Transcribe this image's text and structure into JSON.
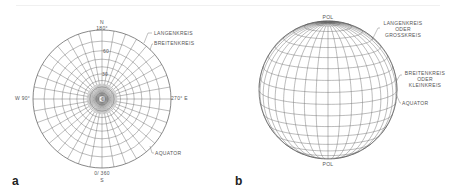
{
  "figure": {
    "panel_a": {
      "label": "a",
      "title_n": "N",
      "top_deg": "180°",
      "ring_60": "60",
      "ring_30": "30",
      "center": "0",
      "west": "W  90°",
      "east": "270° E",
      "bottom_deg": "0/ 360",
      "title_s": "S",
      "callouts": {
        "meridian": "LANGENKREIS",
        "parallel": "BREITENKREIS",
        "equator": "AQUATOR"
      }
    },
    "panel_b": {
      "label": "b",
      "north_pole": "POL",
      "south_pole": "POL",
      "callouts": {
        "meridian_l1": "LANGENKREIS",
        "meridian_l2": "ODER",
        "meridian_l3": "GROSSKREIS",
        "parallel_l1": "BREITENKREIS",
        "parallel_l2": "ODER",
        "parallel_l3": "KLEINKREIS",
        "equator": "AQUATOR"
      }
    }
  },
  "colors": {
    "line": "#6a6a6a",
    "text": "#555555",
    "background": "#ffffff"
  }
}
